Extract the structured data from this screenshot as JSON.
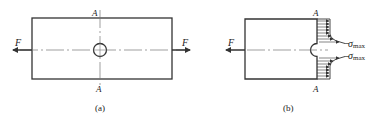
{
  "figure": {
    "panel_a": {
      "caption": "(a)",
      "section_label_top": "A",
      "section_label_bottom": "A",
      "force_left": "F",
      "force_right": "F"
    },
    "panel_b": {
      "caption": "(b)",
      "section_label_top": "A",
      "section_label_bottom": "A",
      "force_left": "F",
      "stress_label_upper": "σ",
      "stress_label_upper_sub": "max",
      "stress_label_lower": "σ",
      "stress_label_lower_sub": "max"
    },
    "colors": {
      "line": "#333333",
      "centerline": "#777777",
      "background": "#ffffff"
    }
  }
}
